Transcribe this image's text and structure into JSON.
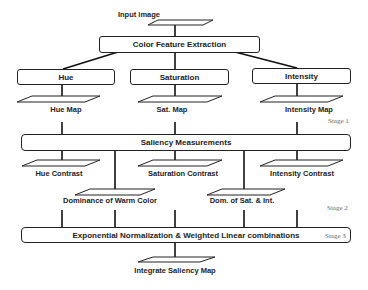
{
  "diagram": {
    "input": {
      "label": "Input image"
    },
    "color_feature_extraction": {
      "label": "Color Feature Extraction"
    },
    "channels": [
      {
        "label": "Hue",
        "map": "Hue Map"
      },
      {
        "label": "Saturation",
        "map": "Sat. Map"
      },
      {
        "label": "Intensity",
        "map": "Intensity Map"
      }
    ],
    "saliency_measurements": {
      "label": "Saliency Measurements"
    },
    "contrasts": [
      {
        "label": "Hue Contrast"
      },
      {
        "label": "Saturation Contrast"
      },
      {
        "label": "Intensity Contrast"
      }
    ],
    "dominances": [
      {
        "label": "Dominance of Warm Color"
      },
      {
        "label": "Dom. of Sat. & Int."
      }
    ],
    "combination": {
      "label": "Exponential Normalization & Weighted Linear combinations"
    },
    "output": {
      "label": "Integrate Saliency Map"
    },
    "stages": [
      {
        "label": "Stage 1"
      },
      {
        "label": "Stage 2"
      },
      {
        "label": "Stage 3"
      }
    ]
  }
}
